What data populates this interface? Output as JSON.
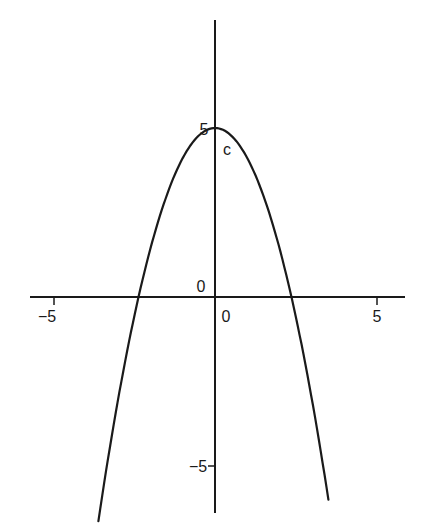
{
  "chart_data": {
    "type": "line",
    "title": "",
    "xlabel": "",
    "ylabel": "",
    "function": "y = c - a*x^2 (downward parabola)",
    "series": [
      {
        "name": "parabola",
        "x": [
          -3.6,
          -3.0,
          -2.5,
          -2.36,
          -2.0,
          -1.5,
          -1.0,
          -0.5,
          0,
          0.5,
          1.0,
          1.5,
          2.0,
          2.36,
          2.5,
          3.0,
          3.5
        ],
        "y": [
          -6.66,
          -3.1,
          -0.63,
          0,
          1.4,
          2.98,
          4.1,
          4.78,
          5,
          4.78,
          4.1,
          2.98,
          1.4,
          0,
          -0.63,
          -3.1,
          -6.03
        ]
      }
    ],
    "vertex": {
      "x": 0,
      "y": 5,
      "label": "c"
    },
    "roots": [
      -2.36,
      2.36
    ],
    "xlim": [
      -5.7,
      5.9
    ],
    "ylim": [
      -6.5,
      8.2
    ],
    "x_ticks": [
      {
        "value": -5,
        "label": "−5"
      },
      {
        "value": 5,
        "label": "5"
      }
    ],
    "y_ticks": [
      {
        "value": 5,
        "label": "5"
      },
      {
        "value": -5,
        "label": "−5"
      }
    ],
    "origin_labels": {
      "x_zero": "0",
      "y_zero": "0"
    },
    "grid": false,
    "legend": null
  },
  "colors": {
    "axis": "#1a1a1a",
    "curve": "#1a1a1a",
    "background": "#ffffff"
  }
}
